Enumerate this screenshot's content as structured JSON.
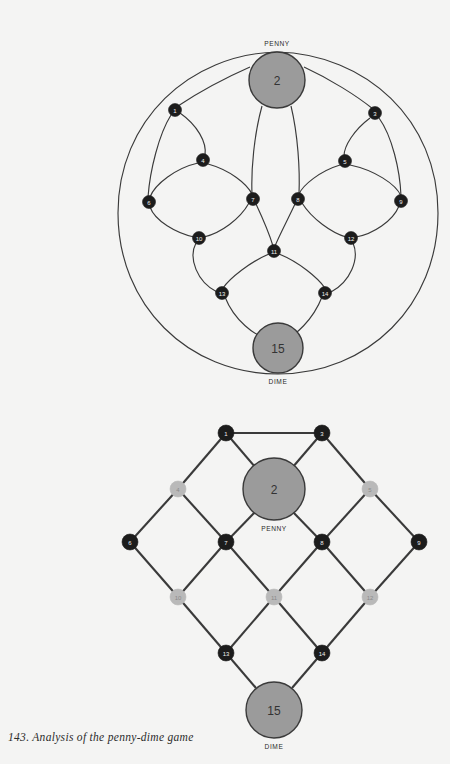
{
  "figure": {
    "caption": "143. Analysis of the penny-dime game",
    "background_color": "#f4f4f3",
    "node_dark_color": "#1c1c1c",
    "node_light_color": "#b9b9b9",
    "coin_fill_color": "#9b9b9b",
    "edge_color": "#3a3a3a"
  },
  "labels": {
    "penny": "PENNY",
    "dime": "DIME"
  },
  "top_diagram": {
    "name": "circular-curved-layout",
    "nodes": [
      {
        "id": "1",
        "label": "1",
        "x": 175,
        "y": 110,
        "r": 6,
        "style": "dark"
      },
      {
        "id": "2",
        "label": "2",
        "x": 277,
        "y": 80,
        "r": 28,
        "style": "coin",
        "coin": "PENNY"
      },
      {
        "id": "3",
        "label": "3",
        "x": 375,
        "y": 113,
        "r": 6,
        "style": "dark"
      },
      {
        "id": "4",
        "label": "4",
        "x": 203,
        "y": 160,
        "r": 6,
        "style": "dark"
      },
      {
        "id": "5",
        "label": "5",
        "x": 345,
        "y": 161,
        "r": 6,
        "style": "dark"
      },
      {
        "id": "6",
        "label": "6",
        "x": 149,
        "y": 202,
        "r": 6,
        "style": "dark"
      },
      {
        "id": "7",
        "label": "7",
        "x": 253,
        "y": 199,
        "r": 6,
        "style": "dark"
      },
      {
        "id": "8",
        "label": "8",
        "x": 298,
        "y": 199,
        "r": 6,
        "style": "dark"
      },
      {
        "id": "9",
        "label": "9",
        "x": 401,
        "y": 201,
        "r": 6,
        "style": "dark"
      },
      {
        "id": "10",
        "label": "10",
        "x": 199,
        "y": 238,
        "r": 6,
        "style": "dark"
      },
      {
        "id": "11",
        "label": "11",
        "x": 274,
        "y": 251,
        "r": 6,
        "style": "dark"
      },
      {
        "id": "12",
        "label": "12",
        "x": 351,
        "y": 238,
        "r": 6,
        "style": "dark"
      },
      {
        "id": "13",
        "label": "13",
        "x": 222,
        "y": 293,
        "r": 6,
        "style": "dark"
      },
      {
        "id": "14",
        "label": "14",
        "x": 325,
        "y": 293,
        "r": 6,
        "style": "dark"
      },
      {
        "id": "15",
        "label": "15",
        "x": 278,
        "y": 348,
        "r": 25,
        "style": "coin",
        "coin": "DIME"
      }
    ],
    "edges": [
      [
        "2",
        "1"
      ],
      [
        "2",
        "3"
      ],
      [
        "2",
        "7"
      ],
      [
        "2",
        "8"
      ],
      [
        "1",
        "4"
      ],
      [
        "1",
        "6"
      ],
      [
        "3",
        "5"
      ],
      [
        "3",
        "9"
      ],
      [
        "4",
        "6"
      ],
      [
        "4",
        "7"
      ],
      [
        "5",
        "8"
      ],
      [
        "5",
        "9"
      ],
      [
        "6",
        "10"
      ],
      [
        "7",
        "10"
      ],
      [
        "7",
        "11"
      ],
      [
        "8",
        "11"
      ],
      [
        "8",
        "12"
      ],
      [
        "9",
        "12"
      ],
      [
        "10",
        "13"
      ],
      [
        "11",
        "13"
      ],
      [
        "11",
        "14"
      ],
      [
        "12",
        "14"
      ],
      [
        "13",
        "15"
      ],
      [
        "14",
        "15"
      ],
      [
        "15",
        "1"
      ],
      [
        "15",
        "3"
      ]
    ]
  },
  "bottom_diagram": {
    "name": "diamond-lattice-layout",
    "nodes": [
      {
        "id": "1",
        "label": "1",
        "x": 226,
        "y": 33,
        "r": 8,
        "style": "dark"
      },
      {
        "id": "2",
        "label": "2",
        "x": 274,
        "y": 89,
        "r": 31,
        "style": "coin",
        "coin": "PENNY"
      },
      {
        "id": "3",
        "label": "3",
        "x": 322,
        "y": 33,
        "r": 8,
        "style": "dark"
      },
      {
        "id": "4",
        "label": "4",
        "x": 178,
        "y": 89,
        "r": 8,
        "style": "light"
      },
      {
        "id": "5",
        "label": "5",
        "x": 370,
        "y": 89,
        "r": 8,
        "style": "light"
      },
      {
        "id": "6",
        "label": "6",
        "x": 130,
        "y": 142,
        "r": 8,
        "style": "dark"
      },
      {
        "id": "7",
        "label": "7",
        "x": 226,
        "y": 142,
        "r": 8,
        "style": "dark"
      },
      {
        "id": "8",
        "label": "8",
        "x": 322,
        "y": 142,
        "r": 8,
        "style": "dark"
      },
      {
        "id": "9",
        "label": "9",
        "x": 419,
        "y": 142,
        "r": 8,
        "style": "dark"
      },
      {
        "id": "10",
        "label": "10",
        "x": 178,
        "y": 197,
        "r": 8,
        "style": "light"
      },
      {
        "id": "11",
        "label": "11",
        "x": 274,
        "y": 197,
        "r": 8,
        "style": "light"
      },
      {
        "id": "12",
        "label": "12",
        "x": 370,
        "y": 197,
        "r": 8,
        "style": "light"
      },
      {
        "id": "13",
        "label": "13",
        "x": 226,
        "y": 253,
        "r": 8,
        "style": "dark"
      },
      {
        "id": "14",
        "label": "14",
        "x": 322,
        "y": 253,
        "r": 8,
        "style": "dark"
      },
      {
        "id": "15",
        "label": "15",
        "x": 274,
        "y": 310,
        "r": 28,
        "style": "coin",
        "coin": "DIME"
      }
    ],
    "edges": [
      [
        "1",
        "3"
      ],
      [
        "1",
        "4"
      ],
      [
        "1",
        "2"
      ],
      [
        "3",
        "2"
      ],
      [
        "3",
        "5"
      ],
      [
        "4",
        "6"
      ],
      [
        "4",
        "7"
      ],
      [
        "2",
        "7"
      ],
      [
        "2",
        "8"
      ],
      [
        "5",
        "8"
      ],
      [
        "5",
        "9"
      ],
      [
        "6",
        "10"
      ],
      [
        "7",
        "10"
      ],
      [
        "7",
        "11"
      ],
      [
        "8",
        "11"
      ],
      [
        "8",
        "12"
      ],
      [
        "9",
        "12"
      ],
      [
        "10",
        "13"
      ],
      [
        "11",
        "13"
      ],
      [
        "11",
        "14"
      ],
      [
        "12",
        "14"
      ],
      [
        "13",
        "15"
      ],
      [
        "14",
        "15"
      ]
    ]
  }
}
